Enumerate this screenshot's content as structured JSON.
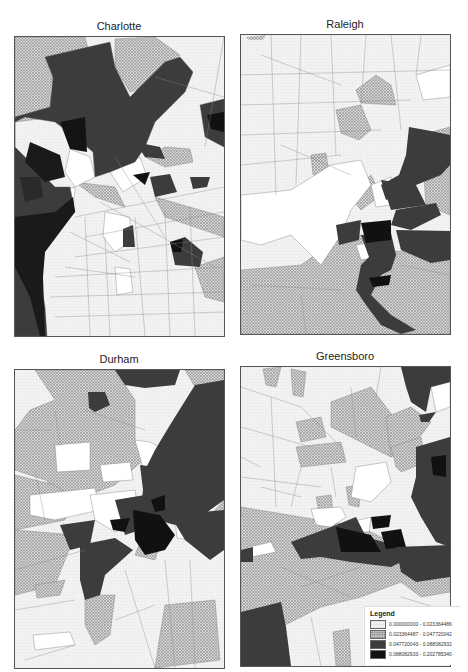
{
  "figure": {
    "panels": [
      {
        "id": "charlotte",
        "title": "Charlotte"
      },
      {
        "id": "raleigh",
        "title": "Raleigh"
      },
      {
        "id": "durham",
        "title": "Durham"
      },
      {
        "id": "greensboro",
        "title": "Greensboro"
      }
    ],
    "legend": {
      "title": "Legend",
      "classes": [
        {
          "label": "0.000000000 - 0.023364486",
          "fill": "light-grid",
          "color": "#f4f4f4"
        },
        {
          "label": "0.023364487 - 0.047720042",
          "fill": "crosshatch",
          "color": "#cfcfcf"
        },
        {
          "label": "0.047720043 - 0.088082932",
          "fill": "dark-gray",
          "color": "#3c3c3c"
        },
        {
          "label": "0.088082933 - 0.202785340",
          "fill": "black",
          "color": "#111111"
        }
      ]
    }
  }
}
